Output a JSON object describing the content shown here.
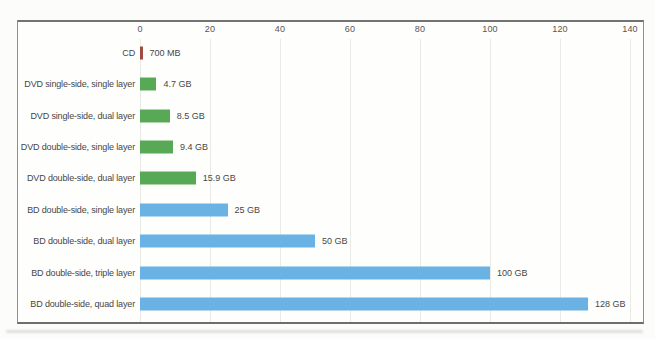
{
  "chart_data": {
    "type": "bar",
    "orientation": "horizontal",
    "title": "",
    "xlabel": "",
    "ylabel": "",
    "xlim": [
      0,
      140
    ],
    "x_ticks": [
      0,
      20,
      40,
      60,
      80,
      100,
      120,
      140
    ],
    "unit": "GB",
    "grid": true,
    "legend": "none",
    "categories": [
      "CD",
      "DVD single-side, single layer",
      "DVD single-side, dual layer",
      "DVD double-side, single layer",
      "DVD double-side, dual layer",
      "BD double-side, single layer",
      "BD double-side, dual layer",
      "BD double-side, triple layer",
      "BD double-side, quad layer"
    ],
    "values": [
      0.7,
      4.7,
      8.5,
      9.4,
      15.9,
      25,
      50,
      100,
      128
    ],
    "value_labels": [
      "700 MB",
      "4.7 GB",
      "8.5 GB",
      "9.4 GB",
      "15.9 GB",
      "25 GB",
      "50 GB",
      "100 GB",
      "128 GB"
    ],
    "bar_colors": [
      "#a04b40",
      "#58a956",
      "#58a956",
      "#58a956",
      "#58a956",
      "#6ab2e4",
      "#6ab2e4",
      "#6ab2e4",
      "#6ab2e4"
    ]
  },
  "colors": {
    "cd_red": "#a04b40",
    "dvd_green": "#58a956",
    "bd_blue": "#6ab2e4",
    "frame_border": "#8f8f8f",
    "gridline": "#e9e9e5",
    "label_text": "#474747",
    "tick_text": "#565656",
    "background": "#fcfcfa"
  }
}
